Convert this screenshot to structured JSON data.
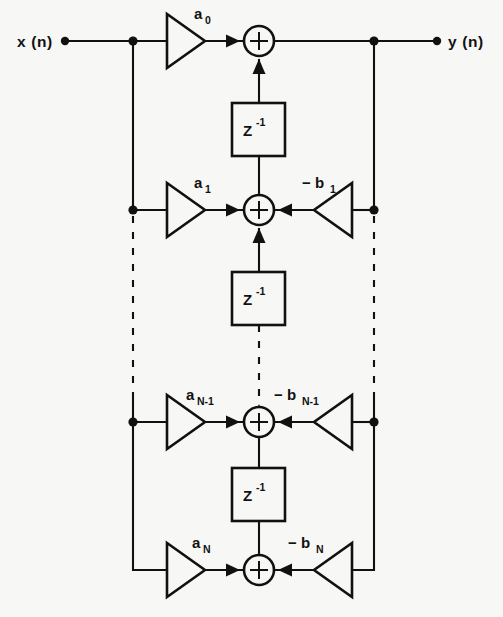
{
  "diagram": {
    "type": "signal-flow-graph",
    "background_color": "#f7f7f5",
    "line_color": "#111111",
    "io": {
      "input_label": "x (n)",
      "output_label": "y (n)"
    },
    "delay_label": {
      "base": "Z",
      "exponent": "-1"
    },
    "adder_symbol": "+",
    "rows": [
      {
        "id": "row-0",
        "feedforward_coefficient": "a",
        "feedforward_subscript": "0",
        "feedback_coefficient": null,
        "feedback_subscript": null,
        "has_feedback_gain": false
      },
      {
        "id": "row-1",
        "feedforward_coefficient": "a",
        "feedforward_subscript": "1",
        "feedback_coefficient": "− b",
        "feedback_subscript": "1",
        "has_feedback_gain": true
      },
      {
        "id": "row-n-minus-1",
        "feedforward_coefficient": "a",
        "feedforward_subscript": "N-1",
        "feedback_coefficient": "− b",
        "feedback_subscript": "N-1",
        "has_feedback_gain": true
      },
      {
        "id": "row-n",
        "feedforward_coefficient": "a",
        "feedforward_subscript": "N",
        "feedback_coefficient": "− b",
        "feedback_subscript": "N",
        "has_feedback_gain": true
      }
    ],
    "delay_elements_count": 3,
    "adders_count": 4,
    "continuation": {
      "style": "dashed",
      "note": "dashed vertical lines indicate repeated stages"
    }
  }
}
